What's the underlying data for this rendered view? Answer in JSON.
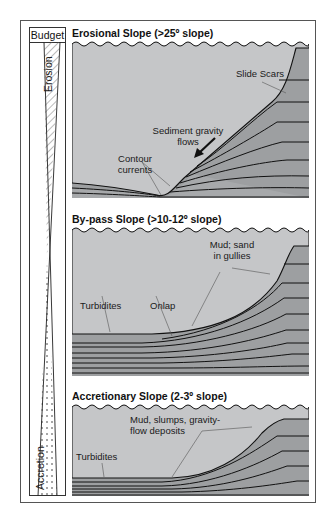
{
  "budget": {
    "label": "Budget",
    "erosion_label": "Erosion",
    "accretion_label": "Accretion"
  },
  "panels": [
    {
      "title": "Erosional Slope (>25º slope)",
      "labels": {
        "slide_scars": "Slide Scars",
        "sgf_1": "Sediment gravity",
        "sgf_2": "flows",
        "contour_1": "Contour",
        "contour_2": "currents"
      }
    },
    {
      "title": "By-pass Slope (>10-12º slope)",
      "labels": {
        "mud_1": "Mud; sand",
        "mud_2": "in gullies",
        "turbidites": "Turbidites",
        "onlap": "Onlap"
      }
    },
    {
      "title": "Accretionary Slope (2-3º slope)",
      "labels": {
        "mud_1": "Mud, slumps, gravity-",
        "mud_2": "flow deposits",
        "turbidites": "Turbidites"
      }
    }
  ],
  "colors": {
    "water": "#c5c6c8",
    "sediment": "#9d9fa1",
    "sediment_light": "#aeb0b2",
    "line": "#111111"
  }
}
